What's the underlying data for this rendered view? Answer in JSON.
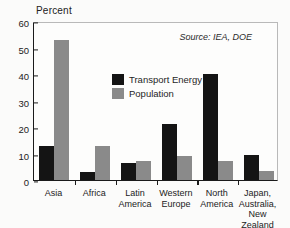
{
  "chart_data": {
    "type": "bar",
    "title": "",
    "subtitle": "",
    "xlabel": "",
    "ylabel": "Percent",
    "ylim": [
      0,
      60
    ],
    "yticks": [
      0,
      10,
      20,
      30,
      40,
      50,
      60
    ],
    "grid": false,
    "legend_position": "inside-center-left",
    "categories": [
      "Asia",
      "Africa",
      "Latin\nAmerica",
      "Western\nEurope",
      "North\nAmerica",
      "Japan,\nAustralia,\nNew Zealand"
    ],
    "series": [
      {
        "name": "Transport Energy",
        "color": "#141414",
        "values": [
          13,
          3,
          6.5,
          21,
          40,
          9.5
        ]
      },
      {
        "name": "Population",
        "color": "#8a8a8a",
        "values": [
          53,
          13,
          7,
          9,
          7,
          3.5
        ]
      }
    ],
    "annotations": [
      {
        "name": "source",
        "text": "Source: IEA, DOE"
      }
    ]
  },
  "axis": {
    "y_title": "Percent",
    "y_tick_labels": [
      "60",
      "50",
      "40",
      "30",
      "20",
      "10",
      "0"
    ]
  },
  "legend": {
    "items": [
      {
        "label": "Transport Energy",
        "color": "#141414"
      },
      {
        "label": "Population",
        "color": "#8a8a8a"
      }
    ]
  },
  "source": {
    "text": "Source: IEA, DOE"
  },
  "category_labels": [
    {
      "lines": [
        "Asia"
      ]
    },
    {
      "lines": [
        "Africa"
      ]
    },
    {
      "lines": [
        "Latin",
        "America"
      ]
    },
    {
      "lines": [
        "Western",
        "Europe"
      ]
    },
    {
      "lines": [
        "North",
        "America"
      ]
    },
    {
      "lines": [
        "Japan,",
        "Australia,",
        "New Zealand"
      ]
    }
  ]
}
